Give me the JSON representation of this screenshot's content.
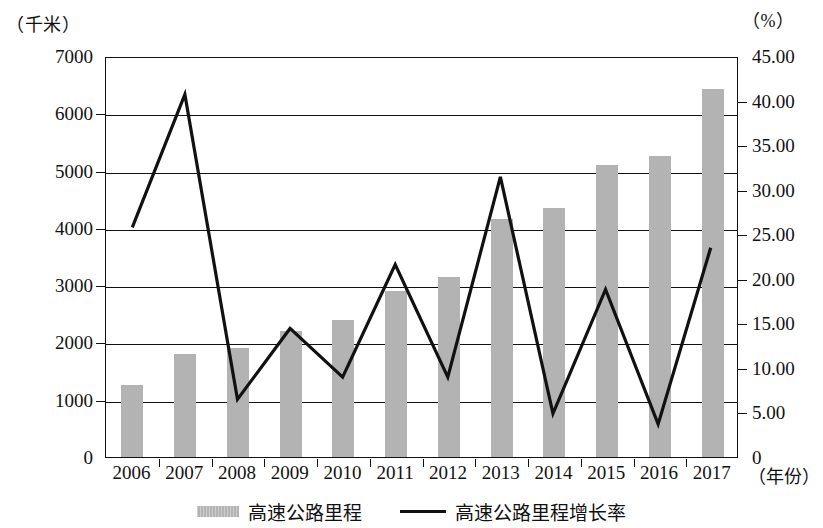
{
  "axes": {
    "left_unit": "（千米）",
    "right_unit": "（%）",
    "x_caption": "（年份）",
    "left_ticks": [
      "0",
      "1000",
      "2000",
      "3000",
      "4000",
      "5000",
      "6000",
      "7000"
    ],
    "right_ticks": [
      "0",
      "5.00",
      "10.00",
      "15.00",
      "20.00",
      "25.00",
      "30.00",
      "35.00",
      "40.00",
      "45.00"
    ],
    "x_ticks": [
      "2006",
      "2007",
      "2008",
      "2009",
      "2010",
      "2011",
      "2012",
      "2013",
      "2014",
      "2015",
      "2016",
      "2017"
    ]
  },
  "legend": {
    "items": [
      {
        "label": "高速公路里程",
        "marker": "bar-swatch",
        "color": "#b3b3b3"
      },
      {
        "label": "高速公路里程增长率",
        "marker": "line-swatch",
        "color": "#111111"
      }
    ]
  },
  "chart_data": {
    "type": "bar",
    "title": "",
    "xlabel": "（年份）",
    "ylabel": "（千米）",
    "y2label": "（%）",
    "categories": [
      "2006",
      "2007",
      "2008",
      "2009",
      "2010",
      "2011",
      "2012",
      "2013",
      "2014",
      "2015",
      "2016",
      "2017"
    ],
    "ylim": [
      0,
      7000
    ],
    "y2lim": [
      0,
      45
    ],
    "grid": true,
    "legend_position": "bottom-center",
    "series": [
      {
        "name": "高速公路里程",
        "type": "bar",
        "axis": "left",
        "unit": "千米",
        "color": "#b3b3b3",
        "values": [
          1250,
          1800,
          1900,
          2200,
          2400,
          2900,
          3150,
          4150,
          4350,
          5100,
          5250,
          6420
        ]
      },
      {
        "name": "高速公路里程增长率",
        "type": "line",
        "axis": "right",
        "unit": "%",
        "color": "#111111",
        "values": [
          25.9,
          40.9,
          6.5,
          14.5,
          9.0,
          21.7,
          9.0,
          31.6,
          4.9,
          18.9,
          3.7,
          23.6
        ]
      }
    ]
  }
}
